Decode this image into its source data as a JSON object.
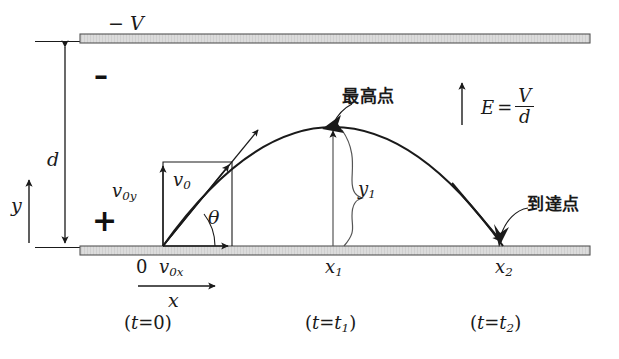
{
  "figure": {
    "background": "#ffffff",
    "ink_color": "#1a1a1a",
    "plate_fill": "#d8d8d8"
  },
  "plates": {
    "top": {
      "label": "− V",
      "polarity_sign": "–",
      "name": "negative plate"
    },
    "bottom": {
      "polarity_sign": "+",
      "name": "positive plate"
    }
  },
  "axes": {
    "y_label": "y",
    "x_label": "x",
    "origin_label": "0",
    "gap_label": "d"
  },
  "field": {
    "symbol": "E",
    "equals": "=",
    "numerator": "V",
    "denominator": "d",
    "full": "E = V/d"
  },
  "velocity": {
    "v0": "v",
    "v0_sub": "0",
    "v0x": "v",
    "v0x_sub": "0x",
    "v0y": "v",
    "v0y_sub": "0y",
    "angle": "θ"
  },
  "annotations": {
    "apex": "最高点",
    "landing": "到達点",
    "height_label": "y",
    "height_sub": "1"
  },
  "markers": [
    {
      "name": "origin",
      "x_label": "0",
      "time_label": "( t = 0 )",
      "t_main": "t",
      "t_eq": "=",
      "t_val": "0",
      "t_sub": ""
    },
    {
      "name": "apex",
      "x_label": "x",
      "x_sub": "1",
      "time_label": "( t = t₁ )",
      "t_main": "t",
      "t_eq": "=",
      "t_val": "t",
      "t_sub": "1"
    },
    {
      "name": "landing",
      "x_label": "x",
      "x_sub": "2",
      "time_label": "( t = t₂ )",
      "t_main": "t",
      "t_eq": "=",
      "t_val": "t",
      "t_sub": "2"
    }
  ],
  "geometry": {
    "top_plate_y": 41,
    "bottom_plate_y": 247,
    "plate_left": 80,
    "plate_right": 590,
    "origin_x": 163,
    "apex_x": 333,
    "landing_x": 505
  }
}
